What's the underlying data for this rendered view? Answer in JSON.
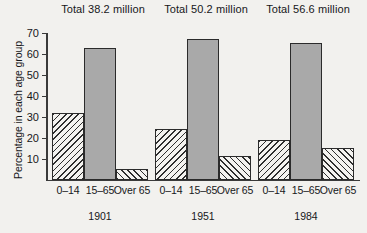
{
  "chart_data": {
    "type": "bar",
    "title": "",
    "xlabel": "",
    "ylabel": "Percentage in each age group",
    "ylim": [
      0,
      70
    ],
    "yticks": [
      10,
      20,
      30,
      40,
      50,
      60,
      70
    ],
    "grid": false,
    "legend": "none",
    "categories": [
      "0–14",
      "15–65",
      "Over 65"
    ],
    "groups": [
      {
        "year": "1901",
        "total_label": "Total 38.2 million",
        "values": [
          32,
          63,
          5
        ]
      },
      {
        "year": "1951",
        "total_label": "Total 50.2 million",
        "values": [
          24,
          67,
          11
        ]
      },
      {
        "year": "1984",
        "total_label": "Total 56.6 million",
        "values": [
          19,
          65,
          15
        ]
      }
    ],
    "series": [
      {
        "name": "0–14",
        "values": [
          32,
          24,
          19
        ]
      },
      {
        "name": "15–65",
        "values": [
          63,
          67,
          65
        ]
      },
      {
        "name": "Over 65",
        "values": [
          5,
          11,
          15
        ]
      }
    ],
    "fills": [
      "hatch-back",
      "solid",
      "hatch-fwd"
    ],
    "colors": {
      "solid_bar": "#a9a9a9",
      "bar_outline": "#2b2b2b",
      "hatch_line": "#2e2e2e",
      "axis": "#3a3a3a",
      "background": "#f2f1ee",
      "text": "#17171a"
    }
  }
}
